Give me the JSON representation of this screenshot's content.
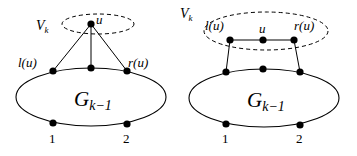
{
  "diagrams": [
    {
      "id": "left",
      "set_label": "V",
      "set_label_sub": "k",
      "vertex_label": "u",
      "left_label": "l(u)",
      "right_label": "r(u)",
      "graph_label": "G",
      "graph_label_sub": "k−1",
      "bottom_left_label": "1",
      "bottom_right_label": "2"
    },
    {
      "id": "right",
      "set_label": "V",
      "set_label_sub": "k",
      "vertex_label": "u",
      "left_label": "l(u)",
      "right_label": "r(u)",
      "graph_label": "G",
      "graph_label_sub": "k−1",
      "bottom_left_label": "1",
      "bottom_right_label": "2"
    }
  ],
  "style": {
    "stroke_color": "#000000",
    "node_color": "#000000",
    "background": "#ffffff"
  }
}
